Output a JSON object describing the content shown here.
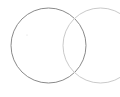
{
  "canvas": {
    "width": 120,
    "height": 97,
    "background": "#ffffff"
  },
  "diagram": {
    "type": "two-overlapping-circles",
    "circles": [
      {
        "name": "left-circle",
        "cx": 48.5,
        "cy": 45.5,
        "r": 37.5,
        "stroke": "#8a8a8a",
        "stroke_width": 1
      },
      {
        "name": "right-circle",
        "cx": 100.5,
        "cy": 45.5,
        "r": 37.5,
        "stroke": "#cacaca",
        "stroke_width": 1
      }
    ],
    "marker": {
      "name": "center-dot",
      "cx": 27,
      "cy": 35,
      "r": 0.6,
      "fill": "#d8d8d8"
    }
  }
}
